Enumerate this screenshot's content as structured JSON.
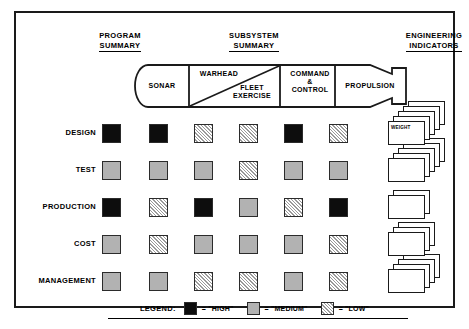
{
  "headers": {
    "program_summary": [
      "PROGRAM",
      "SUMMARY"
    ],
    "subsystem_summary": [
      "SUBSYSTEM",
      "SUMMARY"
    ],
    "engineering_indicators": [
      "ENGINEERING",
      "INDICATORS"
    ]
  },
  "torpedo": {
    "segments": [
      {
        "id": "sonar",
        "label": "SONAR"
      },
      {
        "id": "warhead",
        "label": "WARHEAD"
      },
      {
        "id": "fleet-exercise",
        "label": "FLEET\nEXERCISE",
        "line1": "FLEET",
        "line2": "EXERCISE"
      },
      {
        "id": "command-control",
        "label": "COMMAND\n&\nCONTROL",
        "line1": "COMMAND",
        "line2": "&",
        "line3": "CONTROL"
      },
      {
        "id": "propulsion",
        "label": "PROPULSION"
      }
    ]
  },
  "matrix": {
    "column_names": [
      "PROGRAM SUMMARY",
      "SONAR",
      "WARHEAD",
      "FLEET EXERCISE",
      "COMMAND & CONTROL",
      "PROPULSION"
    ],
    "rows": [
      {
        "label": "DESIGN",
        "summary": "high",
        "cells": [
          "high",
          "low",
          "low",
          "high",
          "low"
        ]
      },
      {
        "label": "TEST",
        "summary": "medium",
        "cells": [
          "medium",
          "medium",
          "low",
          "medium",
          "medium"
        ]
      },
      {
        "label": "PRODUCTION",
        "summary": "high",
        "cells": [
          "low",
          "high",
          "medium",
          "low",
          "high"
        ]
      },
      {
        "label": "COST",
        "summary": "medium",
        "cells": [
          "low",
          "medium",
          "medium",
          "medium",
          "low"
        ]
      },
      {
        "label": "MANAGEMENT",
        "summary": "medium",
        "cells": [
          "medium",
          "low",
          "low",
          "medium",
          "low"
        ]
      }
    ]
  },
  "engineering_indicators": {
    "stacks": [
      {
        "row": "DESIGN",
        "cards": 5,
        "front_label": "WEIGHT"
      },
      {
        "row": "TEST",
        "cards": 5,
        "front_label": ""
      },
      {
        "row": "PRODUCTION",
        "cards": 2,
        "front_label": ""
      },
      {
        "row": "COST",
        "cards": 3,
        "front_label": ""
      },
      {
        "row": "MANAGEMENT",
        "cards": 4,
        "front_label": ""
      }
    ]
  },
  "legend": {
    "title": "LEGEND:",
    "items": [
      {
        "swatch": "high",
        "text": "= \"HIGH\""
      },
      {
        "swatch": "medium",
        "text": "= \"MEDIUM\""
      },
      {
        "swatch": "low",
        "text": "= \"LOW\""
      }
    ]
  },
  "colors": {
    "high": "#0d0d0d",
    "medium": "#b2b2b2",
    "low_hatch": "#9a9a9a",
    "outline": "#1a1a1a",
    "background": "#ffffff"
  }
}
